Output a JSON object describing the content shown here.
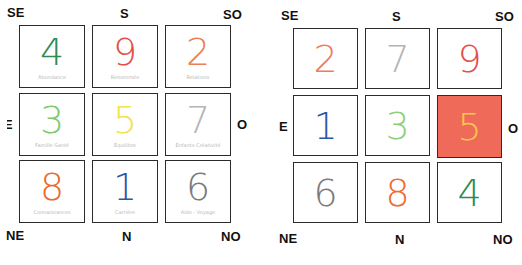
{
  "grids": [
    {
      "name": "left-grid",
      "directions": {
        "se": "SE",
        "s": "S",
        "so": "SO",
        "e": "E",
        "o": "O",
        "ne": "NE",
        "n": "N",
        "no": "NO"
      },
      "cells": [
        {
          "number": "4",
          "label": "Abondance",
          "color": "#2e8b4f"
        },
        {
          "number": "9",
          "label": "Renommée",
          "color": "#e2504a"
        },
        {
          "number": "2",
          "label": "Relations",
          "color": "#ef7d55"
        },
        {
          "number": "3",
          "label": "Famille-Santé",
          "color": "#7fc96a"
        },
        {
          "number": "5",
          "label": "Equilibre",
          "color": "#f1e34a"
        },
        {
          "number": "7",
          "label": "Enfants-Créativité",
          "color": "#b5b5b5"
        },
        {
          "number": "8",
          "label": "Connaissances",
          "color": "#ec6a2e"
        },
        {
          "number": "1",
          "label": "Carrière",
          "color": "#2c57a6"
        },
        {
          "number": "6",
          "label": "Aide - Voyage",
          "color": "#7b7b7b"
        }
      ]
    },
    {
      "name": "right-grid",
      "directions": {
        "se": "SE",
        "s": "S",
        "so": "SO",
        "e": "E",
        "o": "O",
        "ne": "NE",
        "n": "N",
        "no": "NO"
      },
      "cells": [
        {
          "number": "2",
          "label": "",
          "color": "#ef7d55"
        },
        {
          "number": "7",
          "label": "",
          "color": "#b5b5b5"
        },
        {
          "number": "9",
          "label": "",
          "color": "#e2504a"
        },
        {
          "number": "1",
          "label": "",
          "color": "#2c57a6"
        },
        {
          "number": "3",
          "label": "",
          "color": "#8fcf7a"
        },
        {
          "number": "5",
          "label": "",
          "color": "#f6c74a",
          "highlight": true,
          "fill": "#f06a5a"
        },
        {
          "number": "6",
          "label": "",
          "color": "#7b7b7b"
        },
        {
          "number": "8",
          "label": "",
          "color": "#ef6a35"
        },
        {
          "number": "4",
          "label": "",
          "color": "#2e8b4f"
        }
      ]
    }
  ]
}
